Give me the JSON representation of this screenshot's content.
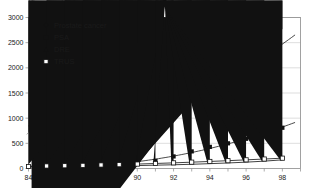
{
  "chart_data": {
    "type": "scatter",
    "title": "",
    "subtitle": "",
    "xlabel": "",
    "ylabel": "",
    "xlim": [
      84,
      99
    ],
    "ylim": [
      0,
      3000
    ],
    "grid": true,
    "legend_position": "top-left",
    "x_tick_labels": [
      "84",
      "86",
      "88",
      "90",
      "92",
      "94",
      "96",
      "98"
    ],
    "x_tick_values": [
      84,
      86,
      88,
      90,
      92,
      94,
      96,
      98
    ],
    "x_minor_tick_values": [
      84,
      85,
      86,
      87,
      88,
      89,
      90,
      91,
      92,
      93,
      94,
      95,
      96,
      97,
      98,
      99
    ],
    "y_tick_labels": [
      "0",
      "500",
      "1000",
      "1500",
      "2000",
      "2500",
      "3000"
    ],
    "y_tick_values": [
      0,
      500,
      1000,
      1500,
      2000,
      2500,
      3000
    ],
    "x": [
      84,
      85,
      86,
      87,
      88,
      89,
      90,
      91,
      92,
      93,
      94,
      95,
      96,
      97,
      98
    ],
    "series": [
      {
        "name": "Prostate cancer",
        "marker": "filled-diamond",
        "color": "#111111",
        "has_trend_line": true,
        "values": [
          660,
          880,
          870,
          1000,
          1060,
          960,
          1090,
          1170,
          1240,
          1450,
          1620,
          1700,
          1880,
          2120,
          2720
        ]
      },
      {
        "name": "PSA",
        "marker": "filled-square",
        "color": "#111111",
        "has_trend_line": true,
        "values": [
          35,
          45,
          50,
          60,
          80,
          80,
          110,
          150,
          240,
          340,
          430,
          500,
          590,
          700,
          810
        ]
      },
      {
        "name": "DRE",
        "marker": "filled-triangle",
        "color": "#111111",
        "has_trend_line": false,
        "values": [
          30,
          35,
          38,
          42,
          48,
          52,
          58,
          66,
          74,
          84,
          96,
          110,
          126,
          146,
          172
        ]
      },
      {
        "name": "TRUS",
        "marker": "open-square",
        "color": "#111111",
        "has_trend_line": false,
        "values": [
          40,
          50,
          55,
          62,
          70,
          76,
          88,
          100,
          112,
          126,
          140,
          155,
          172,
          188,
          205
        ]
      }
    ]
  },
  "legend": {
    "entries": [
      {
        "label": "Prostate cancer",
        "marker": "filled-diamond"
      },
      {
        "label": "PSA",
        "marker": "filled-square"
      },
      {
        "label": "DRE",
        "marker": "filled-triangle"
      },
      {
        "label": "TRUS",
        "marker": "open-square"
      }
    ]
  },
  "colors": {
    "background": "#ffffff",
    "grid": "#c8c8c8",
    "axis": "#8a8a8a",
    "marker": "#111111",
    "line": "#2b2b2b"
  }
}
